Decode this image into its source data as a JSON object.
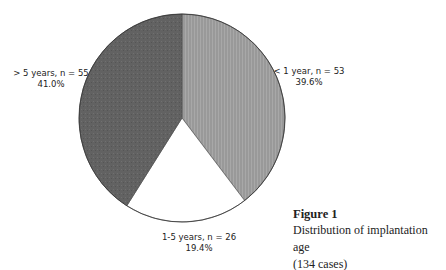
{
  "chart_data": {
    "type": "pie",
    "title": "Figure 1",
    "caption": "Distribution of implantation age (134 cases)",
    "total_cases": 134,
    "slices": [
      {
        "label": "< 1 year, n = 53",
        "category": "< 1 year",
        "n": 53,
        "percent": 39.6,
        "fill": "#9a9a9a",
        "pattern": "vertical-lines"
      },
      {
        "label": "1-5 years, n = 26",
        "category": "1-5 years",
        "n": 26,
        "percent": 19.4,
        "fill": "#ffffff",
        "pattern": "none"
      },
      {
        "label": "> 5 years, n = 55",
        "category": "> 5 years",
        "n": 55,
        "percent": 41.0,
        "fill": "#5e5e5e",
        "pattern": "stipple"
      }
    ]
  },
  "labels": {
    "lt1": {
      "line1": "< 1 year, n = 53",
      "line2": "39.6%"
    },
    "mid": {
      "line1": "1-5 years, n = 26",
      "line2": "19.4%"
    },
    "gt5": {
      "line1": "> 5 years, n = 55",
      "line2": "41.0%"
    }
  },
  "caption": {
    "title": "Figure 1",
    "line1": "Distribution of implantation age",
    "line2": "(134 cases)"
  }
}
